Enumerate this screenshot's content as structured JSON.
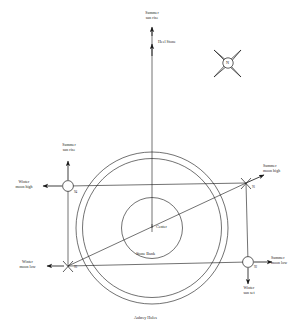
{
  "figure": {
    "kind": "stonehenge-alignment-diagram",
    "stroke_color": "#1a1a1a",
    "background": "#ffffff"
  },
  "compass": {
    "label": "N",
    "name": "compass-rose"
  },
  "center": {
    "label": "Center"
  },
  "rings": {
    "outer_label": "Aubrey Holes",
    "inner_label": "Stone Bank"
  },
  "stations": [
    {
      "id": "94",
      "label": "94",
      "position": "upper-left"
    },
    {
      "id": "91",
      "label": "91",
      "position": "upper-right"
    },
    {
      "id": "92",
      "label": "92",
      "position": "lower-right"
    },
    {
      "id": "93",
      "label": "93",
      "position": "lower-left"
    }
  ],
  "alignments": [
    {
      "key": "summer_sun_rise_top",
      "label": "Summer\nsun rise",
      "direction": "up",
      "at": "top-axis"
    },
    {
      "key": "heel_stone",
      "label": "Heel Stone",
      "direction": "up",
      "at": "axis"
    },
    {
      "key": "summer_sun_rise_left",
      "label": "Summer\nsun rise",
      "direction": "up",
      "at": "station-94"
    },
    {
      "key": "winter_moon_high",
      "label": "Winter\nmoon high",
      "direction": "left",
      "at": "station-94"
    },
    {
      "key": "summer_moon_high",
      "label": "Summer\nmoon high",
      "direction": "up-right",
      "at": "station-91"
    },
    {
      "key": "winter_moon_low",
      "label": "Winter\nmoon low",
      "direction": "left",
      "at": "station-93"
    },
    {
      "key": "summer_moon_low",
      "label": "Summer\nmoon low",
      "direction": "right",
      "at": "station-92"
    },
    {
      "key": "winter_sun_set",
      "label": "Winter\nsun set",
      "direction": "down",
      "at": "station-92"
    }
  ]
}
